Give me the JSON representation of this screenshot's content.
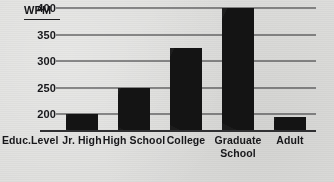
{
  "chart_data": {
    "type": "bar",
    "title": "",
    "ylabel": "WPM",
    "xlabel": "Educ. Level",
    "categories": [
      "Jr. High",
      "High School",
      "College",
      "Graduate School",
      "Adult"
    ],
    "category_lines": [
      [
        "Jr. High",
        ""
      ],
      [
        "High School",
        ""
      ],
      [
        "College",
        ""
      ],
      [
        "Graduate",
        "School"
      ],
      [
        "Adult",
        ""
      ]
    ],
    "values": [
      200,
      250,
      325,
      400,
      195
    ],
    "ylim": [
      170,
      400
    ],
    "yticks": [
      400,
      350,
      300,
      250,
      200
    ],
    "ytick_labels": [
      "400",
      "350",
      "300",
      "250",
      "200"
    ],
    "grid": true,
    "legend": false,
    "bar_color": "#141414",
    "grid_color": "#2a2a2c",
    "background_color": "#dededc",
    "text_color": "#17171a"
  }
}
